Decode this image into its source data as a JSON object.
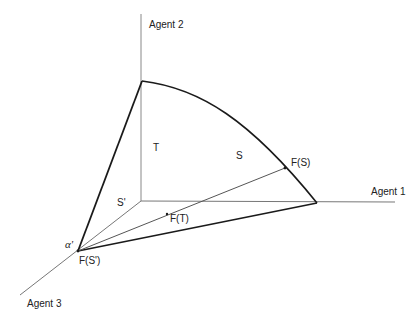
{
  "diagram": {
    "type": "3-agent bargaining simplex",
    "axes": {
      "agent1": "Agent 1",
      "agent2": "Agent 2",
      "agent3": "Agent 3"
    },
    "region_labels": {
      "T": "T",
      "S": "S",
      "S_prime": "S'"
    },
    "point_labels": {
      "F_S": "F(S)",
      "F_T": "F(T)",
      "F_S_prime": "F(S')",
      "alpha_prime": "α'"
    },
    "colors": {
      "axis": "#777777",
      "thick_line": "#1a1a1a",
      "thin_line": "#555555",
      "text": "#222222"
    }
  }
}
